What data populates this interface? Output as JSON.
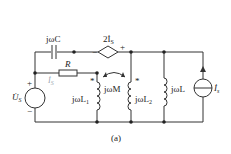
{
  "diagram": {
    "type": "circuit",
    "caption": "(a)",
    "components": {
      "capacitor": {
        "label": "jωC"
      },
      "dependent_source": {
        "label": "2İ",
        "label_sub": "S",
        "minus": "−",
        "plus": "+"
      },
      "resistor": {
        "label": "R"
      },
      "current_label": {
        "label": "İ",
        "sub": "S"
      },
      "voltage_source": {
        "label": "U̇",
        "sub": "S",
        "plus": "+",
        "minus": "−"
      },
      "inductor_L1": {
        "label": "jωL",
        "sub": "1",
        "dot": "*"
      },
      "mutual": {
        "label": "jωM"
      },
      "inductor_L2": {
        "label": "jωL",
        "sub": "2",
        "dot": "*"
      },
      "inductor_L": {
        "label": "jωL"
      },
      "current_source": {
        "label": "İ",
        "sub": "s"
      }
    },
    "colors": {
      "wire": "#333333",
      "text": "#222222",
      "faint_label": "#9aa6b0"
    }
  }
}
